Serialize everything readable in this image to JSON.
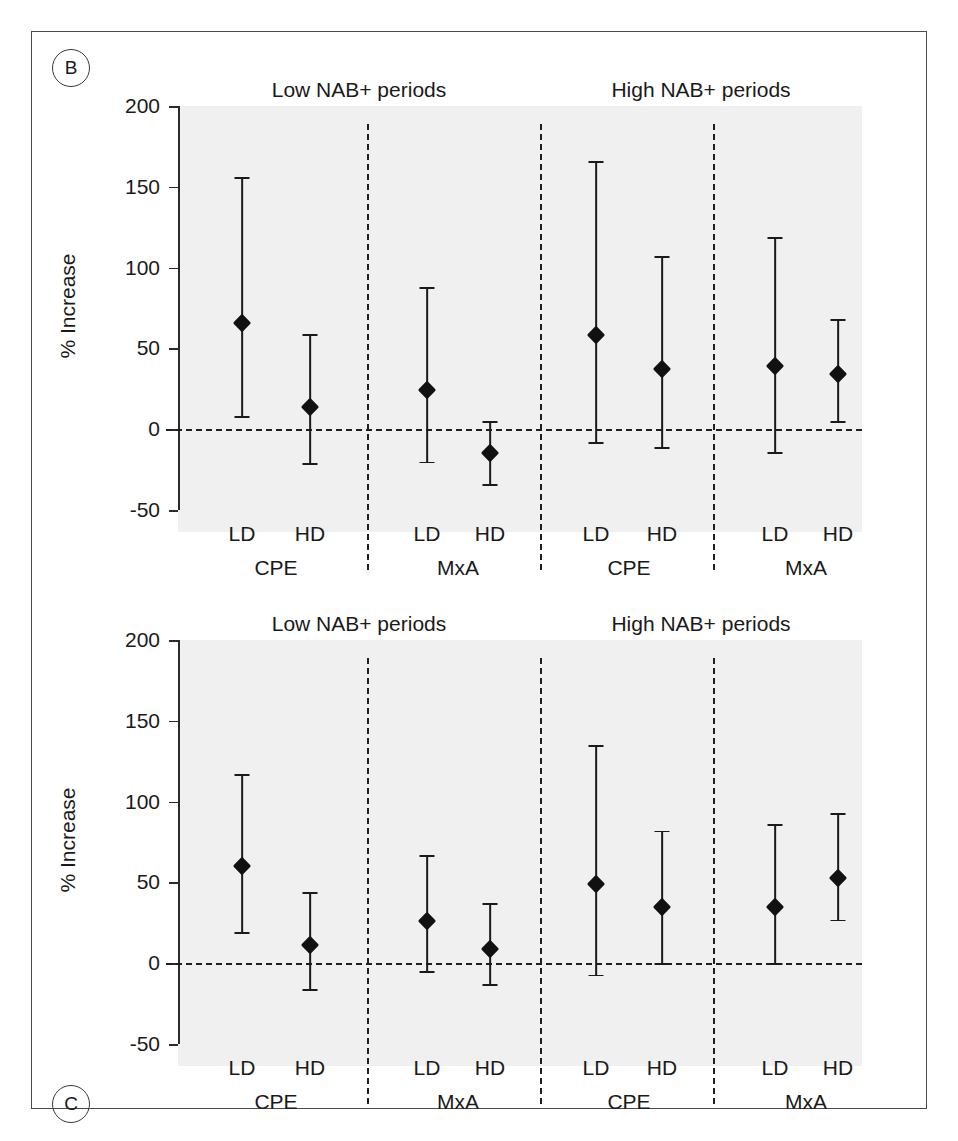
{
  "figure": {
    "panels": [
      {
        "tag": "B",
        "y_axis_title": "% Increase",
        "section_titles": [
          "Low NAB+ periods",
          "High NAB+ periods"
        ],
        "y_ticks": [
          "200",
          "150",
          "100",
          "50",
          "0",
          "-50"
        ],
        "x_tick_labels": [
          "LD",
          "HD",
          "LD",
          "HD",
          "LD",
          "HD",
          "LD",
          "HD"
        ],
        "x_group_labels": [
          "CPE",
          "MxA",
          "CPE",
          "MxA"
        ]
      },
      {
        "tag": "C",
        "y_axis_title": "% Increase",
        "section_titles": [
          "Low NAB+ periods",
          "High NAB+ periods"
        ],
        "y_ticks": [
          "200",
          "150",
          "100",
          "50",
          "0",
          "-50"
        ],
        "x_tick_labels": [
          "LD",
          "HD",
          "LD",
          "HD",
          "LD",
          "HD",
          "LD",
          "HD"
        ],
        "x_group_labels": [
          "CPE",
          "MxA",
          "CPE",
          "MxA"
        ]
      }
    ]
  },
  "chart_data": [
    {
      "type": "scatter",
      "panel": "B",
      "title": "",
      "xlabel": "",
      "ylabel": "% Increase",
      "ylim": [
        -50,
        200
      ],
      "yticks": [
        -50,
        0,
        50,
        100,
        150,
        200
      ],
      "grid": false,
      "legend": null,
      "annotations": [
        "Low NAB+ periods",
        "High NAB+ periods"
      ],
      "reference_line": 0,
      "categories": [
        "Low NAB+ / CPE / LD",
        "Low NAB+ / CPE / HD",
        "Low NAB+ / MxA / LD",
        "Low NAB+ / MxA / HD",
        "High NAB+ / CPE / LD",
        "High NAB+ / CPE / HD",
        "High NAB+ / MxA / LD",
        "High NAB+ / MxA / HD"
      ],
      "values": [
        66,
        14,
        24,
        -15,
        58,
        37,
        39,
        34
      ],
      "ci_lower": [
        8,
        -21,
        -20,
        -34,
        -8,
        -11,
        -14,
        5
      ],
      "ci_upper": [
        156,
        59,
        88,
        5,
        166,
        107,
        119,
        68
      ]
    },
    {
      "type": "scatter",
      "panel": "C",
      "title": "",
      "xlabel": "",
      "ylabel": "% Increase",
      "ylim": [
        -50,
        200
      ],
      "yticks": [
        -50,
        0,
        50,
        100,
        150,
        200
      ],
      "grid": false,
      "legend": null,
      "annotations": [
        "Low NAB+ periods",
        "High NAB+ periods"
      ],
      "reference_line": 0,
      "categories": [
        "Low NAB+ / CPE / LD",
        "Low NAB+ / CPE / HD",
        "Low NAB+ / MxA / LD",
        "Low NAB+ / MxA / HD",
        "High NAB+ / CPE / LD",
        "High NAB+ / CPE / HD",
        "High NAB+ / MxA / LD",
        "High NAB+ / MxA / HD"
      ],
      "values": [
        60,
        11,
        26,
        9,
        49,
        35,
        35,
        53
      ],
      "ci_lower": [
        19,
        -16,
        -5,
        -13,
        -7,
        0,
        0,
        27
      ],
      "ci_upper": [
        117,
        44,
        67,
        37,
        135,
        82,
        86,
        93
      ]
    }
  ]
}
